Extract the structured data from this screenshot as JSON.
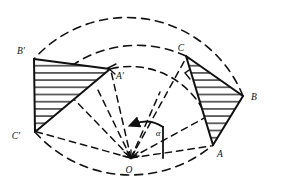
{
  "figure": {
    "background_color": "#ffffff",
    "stroke_color": "#111111",
    "width": 281,
    "height": 179
  },
  "labels": {
    "a_source": "A",
    "b_source": "B",
    "c_source": "C",
    "a_image": "A′",
    "b_image": "B′",
    "c_image": "C′",
    "centre": "O",
    "angle": "α"
  },
  "points": {
    "O": {
      "x": 131,
      "y": 158
    },
    "A": {
      "x": 213,
      "y": 145
    },
    "B": {
      "x": 243,
      "y": 96
    },
    "C": {
      "x": 186,
      "y": 56
    },
    "Ap": {
      "x": 110,
      "y": 69
    },
    "Bp": {
      "x": 34,
      "y": 59
    },
    "Cp": {
      "x": 35,
      "y": 132
    }
  },
  "label_positions": {
    "A": {
      "x": 219,
      "y": 155
    },
    "B": {
      "x": 252,
      "y": 99
    },
    "C": {
      "x": 182,
      "y": 51
    },
    "Ap": {
      "x": 116,
      "y": 78
    },
    "Bp": {
      "x": 21,
      "y": 54
    },
    "Cp": {
      "x": 16,
      "y": 139
    },
    "O": {
      "x": 127,
      "y": 173
    },
    "angle": {
      "x": 158,
      "y": 134
    }
  },
  "arcs": {
    "count": 3,
    "description": "Three concentric dashed rotation arcs from the source vertices A, B, C to their images A′, B′, C′",
    "items": [
      {
        "name": "arc-A-to-Ap",
        "radius": 83,
        "from": "A",
        "to": "Ap"
      },
      {
        "name": "arc-B-to-Bp",
        "radius": 125,
        "from": "B",
        "to": "Bp"
      },
      {
        "name": "arc-C-to-Cp",
        "radius": 116,
        "from": "C",
        "to": "Cp"
      }
    ]
  },
  "radii": {
    "description": "Dashed radial construction lines drawn from the centre O to every vertex",
    "items": [
      "O-A",
      "O-B",
      "O-C",
      "O-A′",
      "O-B′",
      "O-C′"
    ]
  },
  "triangles": {
    "source": {
      "name": "triangle-ABC",
      "vertices": [
        "A",
        "B",
        "C"
      ],
      "fill": "hatched",
      "hatch_direction": "horizontal"
    },
    "image": {
      "name": "triangle-A-prime-B-prime-C-prime",
      "vertices": [
        "A′",
        "B′",
        "C′"
      ],
      "fill": "hatched",
      "hatch_direction": "horizontal"
    }
  },
  "angle_marker": {
    "label": "α",
    "description": "Arc with arrowhead at centre O indicating the direction and magnitude of rotation",
    "direction": "counter-clockwise",
    "radius": 32
  }
}
